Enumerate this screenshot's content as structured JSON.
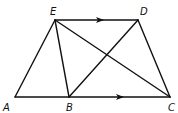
{
  "diagram": {
    "type": "trapezoid-geometry",
    "points": {
      "A": {
        "x": 15,
        "y": 97
      },
      "B": {
        "x": 69,
        "y": 97
      },
      "C": {
        "x": 170,
        "y": 97
      },
      "D": {
        "x": 138,
        "y": 20
      },
      "E": {
        "x": 55,
        "y": 20
      }
    },
    "labels": {
      "A": {
        "text": "A",
        "x": 3,
        "y": 111
      },
      "B": {
        "text": "B",
        "x": 66,
        "y": 111
      },
      "C": {
        "text": "C",
        "x": 168,
        "y": 111
      },
      "D": {
        "text": "D",
        "x": 140,
        "y": 15
      },
      "E": {
        "text": "E",
        "x": 50,
        "y": 15
      }
    },
    "segments": [
      {
        "name": "segment-ED",
        "from": "E",
        "to": "D"
      },
      {
        "name": "segment-AC",
        "from": "A",
        "to": "C"
      },
      {
        "name": "segment-AE",
        "from": "A",
        "to": "E"
      },
      {
        "name": "segment-EB",
        "from": "E",
        "to": "B"
      },
      {
        "name": "segment-EC",
        "from": "E",
        "to": "C"
      },
      {
        "name": "segment-BD",
        "from": "B",
        "to": "D"
      },
      {
        "name": "segment-DC",
        "from": "D",
        "to": "C"
      }
    ],
    "parallel_marks": [
      {
        "name": "arrow-ED",
        "x": 100,
        "y": 20
      },
      {
        "name": "arrow-AC",
        "x": 120,
        "y": 97
      }
    ],
    "stroke_color": "#111111"
  }
}
